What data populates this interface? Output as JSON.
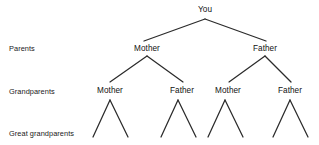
{
  "diagram": {
    "background_color": "#ffffff",
    "line_color": "#2b2b2b",
    "text_color": "#1a1a1a",
    "row_labels": [
      {
        "id": "parents",
        "text": "Parents",
        "x": 9,
        "y": 44
      },
      {
        "id": "grandparents",
        "text": "Grandparents",
        "x": 9,
        "y": 87
      },
      {
        "id": "great-grandparents",
        "text": "Great grandparents",
        "x": 9,
        "y": 129
      }
    ],
    "nodes": [
      {
        "id": "you",
        "text": "You",
        "x": 205,
        "y": 5,
        "generation": "self"
      },
      {
        "id": "parent-mother",
        "text": "Mother",
        "x": 147,
        "y": 44,
        "generation": "parents"
      },
      {
        "id": "parent-father",
        "text": "Father",
        "x": 265,
        "y": 44,
        "generation": "parents"
      },
      {
        "id": "grandparent-maternal-mother",
        "text": "Mother",
        "x": 110,
        "y": 86,
        "generation": "grandparents"
      },
      {
        "id": "grandparent-maternal-father",
        "text": "Father",
        "x": 182,
        "y": 86,
        "generation": "grandparents"
      },
      {
        "id": "grandparent-paternal-mother",
        "text": "Mother",
        "x": 228,
        "y": 86,
        "generation": "grandparents"
      },
      {
        "id": "grandparent-paternal-father",
        "text": "Father",
        "x": 290,
        "y": 86,
        "generation": "grandparents"
      }
    ],
    "connectors": [
      {
        "id": "you-to-parents",
        "apex_x": 205,
        "apex_y": 19,
        "left_x": 144,
        "left_y": 41,
        "right_x": 266,
        "right_y": 41
      },
      {
        "id": "mother-to-grandparents",
        "apex_x": 147,
        "apex_y": 56,
        "left_x": 110,
        "left_y": 82,
        "right_x": 183,
        "right_y": 82
      },
      {
        "id": "father-to-grandparents",
        "apex_x": 265,
        "apex_y": 56,
        "left_x": 229,
        "left_y": 82,
        "right_x": 291,
        "right_y": 82
      },
      {
        "id": "gp-maternal-mother-to-great",
        "apex_x": 110,
        "apex_y": 100,
        "left_x": 93,
        "left_y": 137,
        "right_x": 128,
        "right_y": 137
      },
      {
        "id": "gp-maternal-father-to-great",
        "apex_x": 178,
        "apex_y": 100,
        "left_x": 161,
        "left_y": 137,
        "right_x": 196,
        "right_y": 137
      },
      {
        "id": "gp-paternal-mother-to-great",
        "apex_x": 225,
        "apex_y": 100,
        "left_x": 208,
        "left_y": 137,
        "right_x": 243,
        "right_y": 137
      },
      {
        "id": "gp-paternal-father-to-great",
        "apex_x": 290,
        "apex_y": 100,
        "left_x": 273,
        "left_y": 137,
        "right_x": 308,
        "right_y": 137
      }
    ]
  }
}
